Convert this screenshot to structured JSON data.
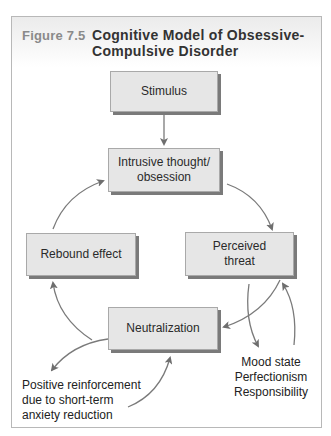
{
  "figure": {
    "number": "Figure 7.5",
    "title_line1": "Cognitive Model of Obsessive-",
    "title_line2": "Compulsive Disorder"
  },
  "nodes": {
    "stimulus": "Stimulus",
    "intrusive_line1": "Intrusive thought/",
    "intrusive_line2": "obsession",
    "rebound": "Rebound effect",
    "perceived_line1": "Perceived",
    "perceived_line2": "threat",
    "neutralization": "Neutralization"
  },
  "annotations": {
    "reinforcement": [
      "Positive reinforcement",
      "due to short-term",
      "anxiety reduction"
    ],
    "factors": [
      "Mood state",
      "Perfectionism",
      "Responsibility"
    ]
  },
  "edges": [
    {
      "from": "Stimulus",
      "to": "Intrusive thought/obsession"
    },
    {
      "from": "Intrusive thought/obsession",
      "to": "Perceived threat"
    },
    {
      "from": "Perceived threat",
      "to": "Neutralization"
    },
    {
      "from": "Perceived threat",
      "to": "Mood state / Perfectionism / Responsibility"
    },
    {
      "from": "Mood state / Perfectionism / Responsibility",
      "to": "Perceived threat"
    },
    {
      "from": "Neutralization",
      "to": "Rebound effect"
    },
    {
      "from": "Rebound effect",
      "to": "Intrusive thought/obsession"
    },
    {
      "from": "Neutralization",
      "to": "Positive reinforcement due to short-term anxiety reduction"
    },
    {
      "from": "Positive reinforcement due to short-term anxiety reduction",
      "to": "Neutralization"
    }
  ],
  "colors": {
    "box_fill": "#e6e6e6",
    "box_shadow": "#7a7a7a",
    "arrow": "#6e6e6e",
    "figure_number": "#8a8a8a"
  }
}
